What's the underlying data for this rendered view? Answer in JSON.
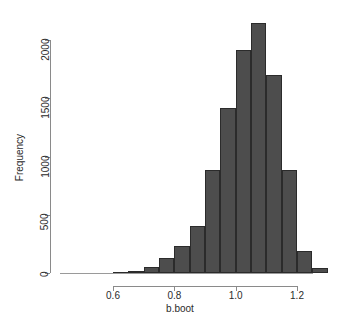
{
  "chart_data": {
    "type": "bar",
    "title": "",
    "xlabel": "b.boot",
    "ylabel": "Frequency",
    "xlim": [
      0.55,
      1.33
    ],
    "ylim": [
      0,
      2200
    ],
    "grid": false,
    "legend": null,
    "bin_width": 0.05,
    "xticks": [
      "0.6",
      "0.8",
      "1.0",
      "1.2"
    ],
    "xtick_values": [
      0.6,
      0.8,
      1.0,
      1.2
    ],
    "yticks": [
      "0",
      "500",
      "1000",
      "1500",
      "2000"
    ],
    "ytick_values": [
      0,
      500,
      1000,
      1500,
      2000
    ],
    "bar_color": "#4d4d4d",
    "bar_edge_color": "#2b2b2b",
    "bins": [
      {
        "x0": 0.6,
        "x1": 0.65,
        "value": 5
      },
      {
        "x0": 0.65,
        "x1": 0.7,
        "value": 20
      },
      {
        "x0": 0.7,
        "x1": 0.75,
        "value": 55
      },
      {
        "x0": 0.75,
        "x1": 0.8,
        "value": 130
      },
      {
        "x0": 0.8,
        "x1": 0.85,
        "value": 235
      },
      {
        "x0": 0.85,
        "x1": 0.9,
        "value": 400
      },
      {
        "x0": 0.9,
        "x1": 0.95,
        "value": 880
      },
      {
        "x0": 0.95,
        "x1": 1.0,
        "value": 1420
      },
      {
        "x0": 1.0,
        "x1": 1.05,
        "value": 1910
      },
      {
        "x0": 1.05,
        "x1": 1.1,
        "value": 2150
      },
      {
        "x0": 1.1,
        "x1": 1.15,
        "value": 1700
      },
      {
        "x0": 1.15,
        "x1": 1.2,
        "value": 880
      },
      {
        "x0": 1.2,
        "x1": 1.25,
        "value": 190
      },
      {
        "x0": 1.25,
        "x1": 1.3,
        "value": 45
      }
    ]
  }
}
